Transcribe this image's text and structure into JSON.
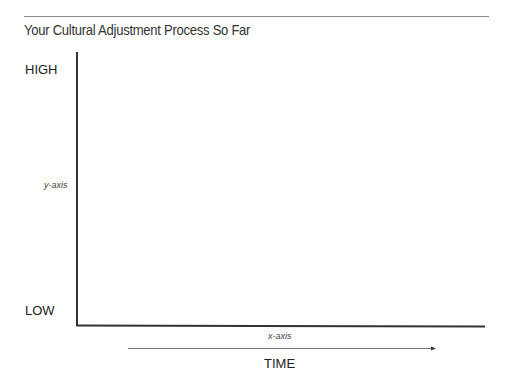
{
  "title": "Your Cultural Adjustment Process So Far",
  "y_axis": {
    "high_label": "HIGH",
    "low_label": "LOW",
    "name": "y-axis"
  },
  "x_axis": {
    "name": "x-axis",
    "direction_label": "TIME"
  },
  "colors": {
    "axis": "#333333",
    "rule": "#888888",
    "arrow": "#555555"
  }
}
